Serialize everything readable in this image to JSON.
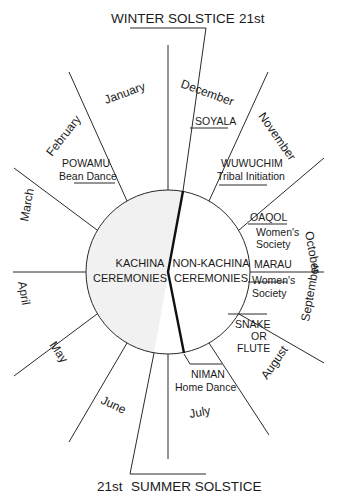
{
  "solstices": {
    "winter": {
      "label": "WINTER SOLSTICE",
      "day": "21st"
    },
    "summer": {
      "label": "SUMMER SOLSTICE",
      "day": "21st"
    }
  },
  "center": {
    "left": {
      "line1": "KACHINA",
      "line2": "CEREMONIES"
    },
    "right": {
      "line1": "NON-KACHINA",
      "line2": "CEREMONIES"
    }
  },
  "months": [
    {
      "name": "January"
    },
    {
      "name": "February"
    },
    {
      "name": "March"
    },
    {
      "name": "April"
    },
    {
      "name": "May"
    },
    {
      "name": "June"
    },
    {
      "name": "July"
    },
    {
      "name": "August"
    },
    {
      "name": "September"
    },
    {
      "name": "October"
    },
    {
      "name": "November"
    },
    {
      "name": "December"
    }
  ],
  "ceremonies": [
    {
      "name": "SOYALA",
      "desc": ""
    },
    {
      "name": "POWAMU",
      "desc": "Bean Dance"
    },
    {
      "name": "WUWUCHIM",
      "desc": "Tribal Initiation"
    },
    {
      "name": "OAQOL",
      "desc": "Women's",
      "desc2": "Society"
    },
    {
      "name": "MARAU",
      "desc": "Women's",
      "desc2": "Society"
    },
    {
      "name": "SNAKE",
      "desc": "OR",
      "desc2": "FLUTE"
    },
    {
      "name": "NIMAN",
      "desc": "Home Dance"
    }
  ],
  "colors": {
    "kachina_fill": "#f1f1f1",
    "line": "#2a2a2a",
    "background": "#ffffff"
  }
}
